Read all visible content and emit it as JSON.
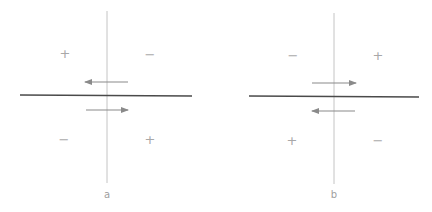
{
  "colors": {
    "axis_horizontal": "#4a4a4a",
    "axis_vertical": "#c4c4c4",
    "arrow": "#8a8a8a",
    "sign": "#a8a8a8",
    "label": "#a0a0a0"
  },
  "panels": [
    {
      "label": "a",
      "horizontal_line": {
        "x1": 20,
        "y1": 95,
        "x2": 192,
        "y2": 96
      },
      "vertical_line": {
        "x": 107,
        "y1": 11,
        "y2": 183
      },
      "arrows": [
        {
          "direction": "left",
          "x_from": 128,
          "x_to": 85,
          "y": 82
        },
        {
          "direction": "right",
          "x_from": 86,
          "x_to": 128,
          "y": 110
        }
      ],
      "signs": [
        {
          "quadrant": "top-left",
          "symbol": "+",
          "x": 65,
          "y": 53
        },
        {
          "quadrant": "top-right",
          "symbol": "−",
          "x": 150,
          "y": 54
        },
        {
          "quadrant": "bottom-left",
          "symbol": "−",
          "x": 64,
          "y": 139
        },
        {
          "quadrant": "bottom-right",
          "symbol": "+",
          "x": 150,
          "y": 139
        }
      ],
      "label_pos": {
        "x": 107,
        "y": 194
      }
    },
    {
      "label": "b",
      "horizontal_line": {
        "x1": 249,
        "y1": 96,
        "x2": 419,
        "y2": 97
      },
      "vertical_line": {
        "x": 334,
        "y1": 13,
        "y2": 184
      },
      "arrows": [
        {
          "direction": "right",
          "x_from": 312,
          "x_to": 356,
          "y": 83
        },
        {
          "direction": "left",
          "x_from": 355,
          "x_to": 312,
          "y": 111
        }
      ],
      "signs": [
        {
          "quadrant": "top-left",
          "symbol": "−",
          "x": 293,
          "y": 55
        },
        {
          "quadrant": "top-right",
          "symbol": "+",
          "x": 378,
          "y": 55
        },
        {
          "quadrant": "bottom-left",
          "symbol": "+",
          "x": 292,
          "y": 140
        },
        {
          "quadrant": "bottom-right",
          "symbol": "−",
          "x": 378,
          "y": 140
        }
      ],
      "label_pos": {
        "x": 334,
        "y": 194
      }
    }
  ]
}
